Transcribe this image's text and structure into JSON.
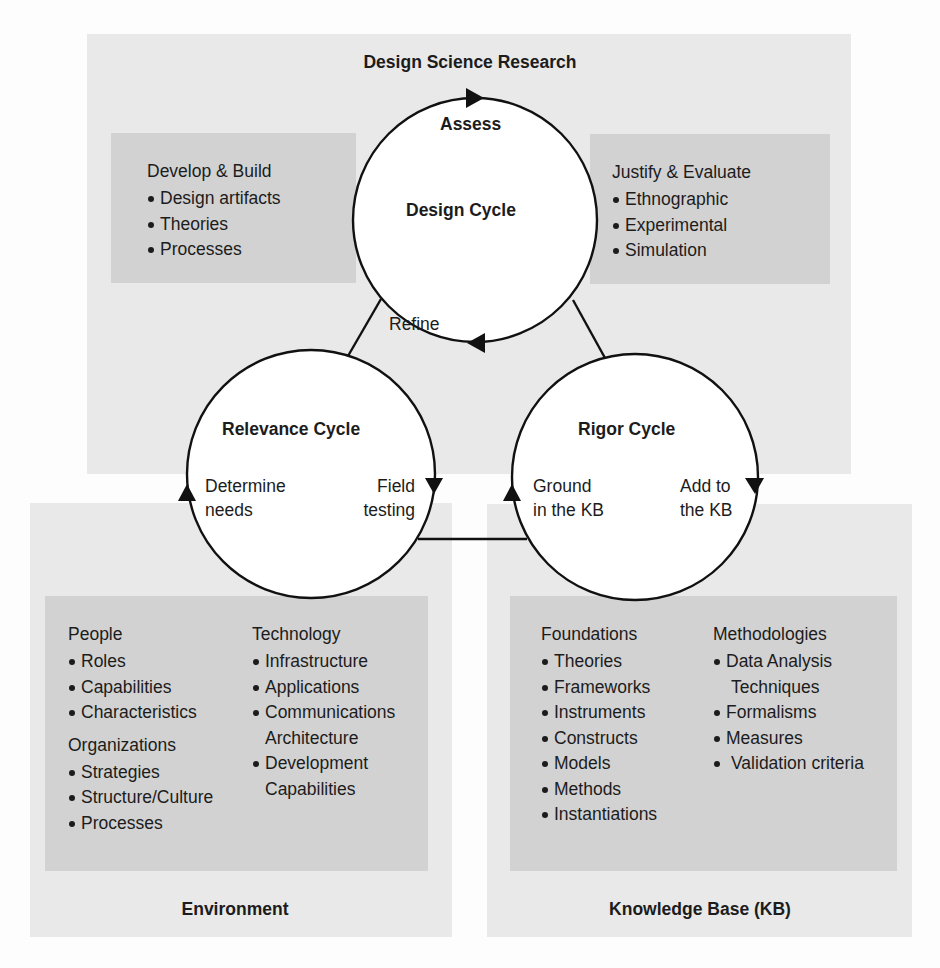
{
  "colors": {
    "outer_panel": "#e9e9e9",
    "inner_box": "#d2d2d2",
    "circle_fill": "#ffffff",
    "stroke": "#111111",
    "text": "#1c1c1c"
  },
  "design_science_research": {
    "title": "Design Science Research",
    "develop_build": {
      "heading": "Develop & Build",
      "items": [
        "Design artifacts",
        "Theories",
        "Processes"
      ]
    },
    "justify_evaluate": {
      "heading": "Justify & Evaluate",
      "items": [
        "Ethnographic",
        "Experimental",
        "Simulation"
      ]
    }
  },
  "cycles": {
    "design": {
      "title": "Design Cycle",
      "top_arrow_label": "Assess",
      "bottom_arrow_label": "Refine"
    },
    "relevance": {
      "title": "Relevance Cycle",
      "left_label_line1": "Determine",
      "left_label_line2": "needs",
      "right_label_line1": "Field",
      "right_label_line2": "testing"
    },
    "rigor": {
      "title": "Rigor Cycle",
      "left_label_line1": "Ground",
      "left_label_line2": "in the KB",
      "right_label_line1": "Add to",
      "right_label_line2": "the KB"
    }
  },
  "environment": {
    "title": "Environment",
    "people": {
      "heading": "People",
      "items": [
        "Roles",
        "Capabilities",
        "Characteristics"
      ]
    },
    "organizations": {
      "heading": "Organizations",
      "items": [
        "Strategies",
        "Structure/Culture",
        "Processes"
      ]
    },
    "technology": {
      "heading": "Technology",
      "items": [
        {
          "line1": "Infrastructure"
        },
        {
          "line1": "Applications"
        },
        {
          "line1": "Communications",
          "line2": "Architecture"
        },
        {
          "line1": "Development",
          "line2": "Capabilities"
        }
      ]
    }
  },
  "knowledge_base": {
    "title": "Knowledge Base (KB)",
    "foundations": {
      "heading": "Foundations",
      "items": [
        "Theories",
        "Frameworks",
        "Instruments",
        "Constructs",
        "Models",
        "Methods",
        "Instantiations"
      ]
    },
    "methodologies": {
      "heading": "Methodologies",
      "items": [
        {
          "line1": "Data Analysis",
          "line2": "Techniques"
        },
        {
          "line1": "Formalisms"
        },
        {
          "line1": "Measures"
        },
        {
          "line1": "Validation criteria"
        }
      ]
    }
  }
}
